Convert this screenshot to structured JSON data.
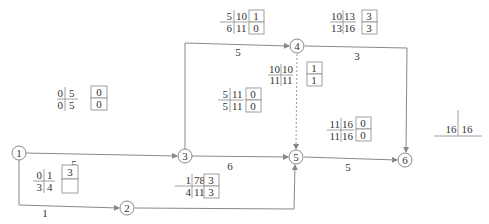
{
  "diagram": {
    "type": "activity-on-arrow network (time parameters)",
    "nodes": [
      {
        "id": "1",
        "label": "1",
        "x": 19,
        "y": 153
      },
      {
        "id": "2",
        "label": "2",
        "x": 127,
        "y": 208
      },
      {
        "id": "3",
        "label": "3",
        "x": 185,
        "y": 156
      },
      {
        "id": "4",
        "label": "4",
        "x": 297,
        "y": 46
      },
      {
        "id": "5",
        "label": "5",
        "x": 296,
        "y": 157
      },
      {
        "id": "6",
        "label": "6",
        "x": 405,
        "y": 160
      }
    ],
    "activities": [
      {
        "from": "1",
        "to": "3",
        "duration": "5",
        "ES": "0",
        "EF": "5",
        "LS": "0",
        "LF": "5",
        "TF": "0",
        "FF": "0"
      },
      {
        "from": "1",
        "to": "2",
        "duration": "1",
        "ES": "0",
        "EF": "1",
        "LS": "3",
        "LF": "4",
        "TF": "3",
        "FF": ""
      },
      {
        "from": "3",
        "to": "4",
        "duration": "5",
        "ES": "5",
        "EF": "10",
        "LS": "6",
        "LF": "11",
        "TF": "1",
        "FF": "0"
      },
      {
        "from": "3",
        "to": "5",
        "duration": "6",
        "ES": "5",
        "EF": "11",
        "LS": "5",
        "LF": "11",
        "TF": "0",
        "FF": "0"
      },
      {
        "from": "4",
        "to": "5",
        "duration": "",
        "dummy": true,
        "ES": "10",
        "EF": "10",
        "LS": "11",
        "LF": "11",
        "TF": "1",
        "FF": "1"
      },
      {
        "from": "4",
        "to": "6",
        "duration": "3",
        "ES": "10",
        "EF": "13",
        "LS": "13",
        "LF": "16",
        "TF": "3",
        "FF": "3"
      },
      {
        "from": "2",
        "to": "5",
        "duration": "",
        "ES": "1",
        "EF": "78",
        "LS": "4",
        "LF": "11",
        "TF": "3",
        "FF": "3"
      },
      {
        "from": "5",
        "to": "6",
        "duration": "5",
        "ES": "11",
        "EF": "16",
        "LS": "11",
        "LF": "16",
        "TF": "0",
        "FF": "0"
      }
    ],
    "project_duration": {
      "calculated": "16",
      "planned": "16"
    }
  }
}
